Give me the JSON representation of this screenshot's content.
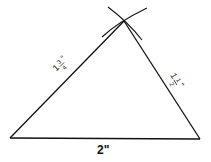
{
  "diagram": {
    "type": "triangle-construction",
    "vertices": {
      "bottom_left": [
        10,
        138
      ],
      "bottom_right": [
        200,
        139
      ],
      "apex": [
        124,
        21
      ]
    },
    "sides": {
      "left": {
        "whole": "1",
        "num": "3",
        "den": "4",
        "unit": "\"",
        "label": "1 3/4\""
      },
      "right": {
        "whole": "1",
        "num": "1",
        "den": "2",
        "unit": "\"",
        "label": "1 1/2\""
      },
      "bottom": {
        "label": "2\""
      }
    },
    "construction_arcs": 2,
    "colors": {
      "line": "#111111",
      "background": "#ffffff"
    }
  }
}
